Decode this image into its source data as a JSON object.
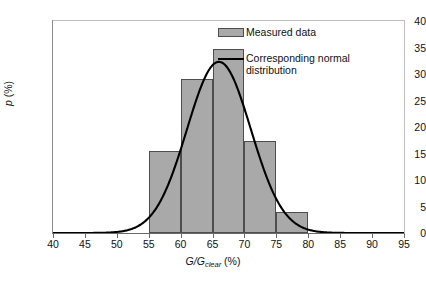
{
  "chart_data": {
    "type": "bar",
    "title": "",
    "subtitle": "",
    "xlabel": "G/G_clear (%)",
    "ylabel": "p (%)",
    "xlim": [
      40,
      95
    ],
    "ylim": [
      0,
      40
    ],
    "grid": false,
    "legend_position": "top-right",
    "xticks": [
      40,
      45,
      50,
      55,
      60,
      65,
      70,
      75,
      80,
      85,
      90,
      95
    ],
    "yticks": [
      0,
      5,
      10,
      15,
      20,
      25,
      30,
      35,
      40
    ],
    "bin_edges": [
      55,
      60,
      65,
      70,
      75,
      80
    ],
    "categories": [
      "55-60",
      "60-65",
      "65-70",
      "70-75",
      "75-80"
    ],
    "values": [
      15.4,
      29.0,
      34.8,
      17.3,
      3.9
    ],
    "series": [
      {
        "name": "Measured data",
        "type": "bar",
        "values": [
          15.4,
          29.0,
          34.8,
          17.3,
          3.9
        ],
        "color": "#a9a9a9",
        "edge_color": "#4d4d4d"
      },
      {
        "name": "Corresponding normal distribution",
        "type": "line",
        "color": "#000000",
        "mean": 66.0,
        "std_dev": 5.0,
        "peak_value": 32.3,
        "peak_x": 66.0
      }
    ]
  },
  "axes": {
    "y_label_main": "p",
    "y_label_unit": " (%)",
    "x_label_main": "G/G",
    "x_label_sub": "clear",
    "x_label_unit": " (%)",
    "y_tick_labels": [
      "0",
      "5",
      "10",
      "15",
      "20",
      "25",
      "30",
      "35",
      "40"
    ],
    "x_tick_labels": [
      "40",
      "45",
      "50",
      "55",
      "60",
      "65",
      "70",
      "75",
      "80",
      "85",
      "90",
      "95"
    ]
  },
  "legend": {
    "items": [
      {
        "label": "Measured data",
        "marker": "swatch"
      },
      {
        "label": "Corresponding normal distribution",
        "marker": "line"
      }
    ]
  },
  "colors": {
    "bar_fill": "#a9a9a9",
    "bar_edge": "#4d4d4d",
    "curve": "#000000",
    "axis": "#6a6a6a",
    "background": "#ffffff"
  }
}
